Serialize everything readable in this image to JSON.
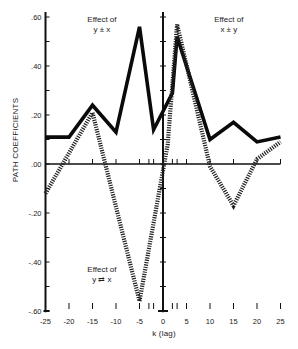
{
  "chart_data": {
    "type": "line",
    "title": "",
    "xlabel": "k (lag)",
    "ylabel": "PATH COEFFICIENTS",
    "xlim": [
      -25,
      25
    ],
    "ylim": [
      -0.6,
      0.6
    ],
    "grid": false,
    "legend": "none (inline annotations)",
    "x_ticks": [
      -25,
      -20,
      -15,
      -10,
      -5,
      0,
      5,
      10,
      15,
      20,
      25
    ],
    "x_tick_labels": [
      "-25",
      "-20",
      "-15",
      "-10",
      "-5",
      "0",
      "5",
      "10",
      "15",
      "20",
      "25"
    ],
    "x_minor_ticks": [
      -3,
      -2,
      2,
      3
    ],
    "y_ticks": [
      0.6,
      0.5,
      0.4,
      0.3,
      0.2,
      0.1,
      0.0,
      -0.1,
      -0.2,
      -0.3,
      -0.4,
      -0.5,
      -0.6
    ],
    "y_tick_labels": [
      ".60",
      "",
      ".40",
      "",
      ".20",
      "",
      ".00",
      "",
      "-.20",
      "",
      "-.40",
      "",
      "-.60"
    ],
    "series": [
      {
        "name": "solid",
        "style": "solid",
        "x": [
          -25,
          -20,
          -15,
          -10,
          -5,
          -2,
          2,
          3,
          10,
          15,
          20,
          25
        ],
        "values": [
          0.11,
          0.11,
          0.24,
          0.13,
          0.56,
          0.14,
          0.29,
          0.52,
          0.1,
          0.17,
          0.09,
          0.11
        ]
      },
      {
        "name": "dotted",
        "style": "dotted",
        "x": [
          -25,
          -15,
          -5,
          1,
          3,
          10,
          15,
          20,
          25
        ],
        "values": [
          -0.12,
          0.21,
          -0.56,
          0.08,
          0.57,
          -0.01,
          -0.17,
          0.02,
          0.09
        ]
      }
    ],
    "annotations": [
      {
        "text_line1": "Effect of",
        "text_line2": "y ± x",
        "k": -13,
        "value": 0.58
      },
      {
        "text_line1": "Effect of",
        "text_line2": "x ± y",
        "k": 14,
        "value": 0.58
      },
      {
        "text_line1": "Effect of",
        "text_line2": "y ⇄ x",
        "k": -13,
        "value": -0.44
      }
    ]
  }
}
